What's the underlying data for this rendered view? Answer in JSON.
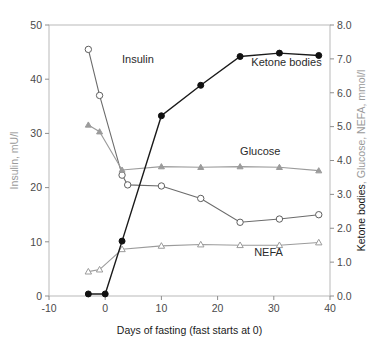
{
  "chart_data": {
    "type": "line",
    "title": "",
    "xlabel": "Days of fasting (fast starts at 0)",
    "ylabel_left": "Insulin, mU/l",
    "ylabel_right_black": "Ketone bodies",
    "ylabel_right_gray": ", Glucose, NEFA, mmol/l",
    "xlim": [
      -10,
      40
    ],
    "ylim_left": [
      0,
      50
    ],
    "ylim_right": [
      0.0,
      8.0
    ],
    "xticks": [
      -10,
      0,
      10,
      20,
      30,
      40
    ],
    "xtick_labels": [
      "-10",
      "0",
      "10",
      "20",
      "30",
      "40"
    ],
    "yticks_left": [
      0,
      10,
      20,
      30,
      40,
      50
    ],
    "ytick_labels_left": [
      "0",
      "10",
      "20",
      "30",
      "40",
      "50"
    ],
    "yticks_right": [
      0.0,
      1.0,
      2.0,
      3.0,
      4.0,
      5.0,
      6.0,
      7.0,
      8.0
    ],
    "ytick_labels_right": [
      "0.0",
      "1.0",
      "2.0",
      "3.0",
      "4.0",
      "5.0",
      "6.0",
      "7.0",
      "8.0"
    ],
    "grid": false,
    "legend_position": "inline-annotations",
    "series": [
      {
        "name": "Insulin",
        "axis": "left",
        "unit": "mU/l",
        "marker": "open-circle",
        "color": "#6b6b6b",
        "label_text": "Insulin",
        "label_x": 3.0,
        "label_y": 43.0,
        "x": [
          -3,
          -1,
          3,
          4,
          10,
          17,
          24,
          31,
          38
        ],
        "y": [
          45.5,
          37.0,
          22.3,
          20.5,
          20.3,
          18.0,
          13.6,
          14.2,
          15.0
        ]
      },
      {
        "name": "Glucose",
        "axis": "right",
        "unit": "mmol/l",
        "marker": "filled-triangle",
        "color": "#9b9b9b",
        "label_text": "Glucose",
        "label_x": 24.0,
        "label_y": 4.15,
        "x": [
          -3,
          -1,
          3,
          10,
          17,
          24,
          31,
          38
        ],
        "y": [
          5.05,
          4.85,
          3.72,
          3.82,
          3.8,
          3.82,
          3.8,
          3.7
        ]
      },
      {
        "name": "NEFA",
        "axis": "right",
        "unit": "mmol/l",
        "marker": "open-triangle",
        "color": "#9b9b9b",
        "label_text": "NEFA",
        "label_x": 26.5,
        "label_y": 1.18,
        "x": [
          -3,
          -1,
          3,
          10,
          17,
          24,
          31,
          38
        ],
        "y": [
          0.72,
          0.78,
          1.38,
          1.48,
          1.52,
          1.5,
          1.5,
          1.58
        ]
      },
      {
        "name": "Ketone bodies",
        "axis": "right",
        "unit": "mmol/l",
        "marker": "filled-circle",
        "color": "#111111",
        "label_text": "Ketone bodies",
        "label_x": 26.0,
        "label_y": 6.78,
        "x": [
          -3,
          0,
          3,
          10,
          17,
          24,
          31,
          38
        ],
        "y": [
          0.06,
          0.06,
          1.62,
          5.32,
          6.22,
          7.07,
          7.17,
          7.1
        ]
      }
    ]
  }
}
